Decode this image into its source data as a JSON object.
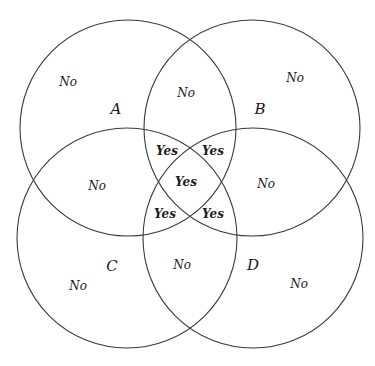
{
  "diagram": {
    "type": "venn",
    "set_count": 4,
    "stroke_color": "#3a3a3a",
    "background": "#ffffff",
    "sets": [
      {
        "id": "A",
        "label": "A",
        "cx": 128,
        "cy": 128,
        "r": 108
      },
      {
        "id": "B",
        "label": "B",
        "cx": 252,
        "cy": 128,
        "r": 108
      },
      {
        "id": "C",
        "label": "C",
        "cx": 127,
        "cy": 238,
        "r": 110
      },
      {
        "id": "D",
        "label": "D",
        "cx": 253,
        "cy": 238,
        "r": 110
      }
    ],
    "set_labels": [
      {
        "text": "A",
        "x": 116,
        "y": 114
      },
      {
        "text": "B",
        "x": 260,
        "y": 114
      },
      {
        "text": "C",
        "x": 112,
        "y": 271
      },
      {
        "text": "D",
        "x": 253,
        "y": 270
      }
    ],
    "regions": [
      {
        "region": "A only",
        "text": "No",
        "x": 68,
        "y": 86
      },
      {
        "region": "A and B",
        "text": "No",
        "x": 186,
        "y": 97
      },
      {
        "region": "B only",
        "text": "No",
        "x": 295,
        "y": 82
      },
      {
        "region": "A and C",
        "text": "No",
        "x": 97,
        "y": 190
      },
      {
        "region": "B and D",
        "text": "No",
        "x": 266,
        "y": 188
      },
      {
        "region": "C only",
        "text": "No",
        "x": 78,
        "y": 290
      },
      {
        "region": "C and D",
        "text": "No",
        "x": 182,
        "y": 269
      },
      {
        "region": "D only",
        "text": "No",
        "x": 299,
        "y": 288
      },
      {
        "region": "A, B, C",
        "text": "Yes",
        "x": 167,
        "y": 155
      },
      {
        "region": "A, B, D",
        "text": "Yes",
        "x": 213,
        "y": 155
      },
      {
        "region": "A, B, C, D",
        "text": "Yes",
        "x": 186,
        "y": 186
      },
      {
        "region": "A, C, D",
        "text": "Yes",
        "x": 165,
        "y": 218
      },
      {
        "region": "B, C, D",
        "text": "Yes",
        "x": 213,
        "y": 218
      }
    ]
  }
}
